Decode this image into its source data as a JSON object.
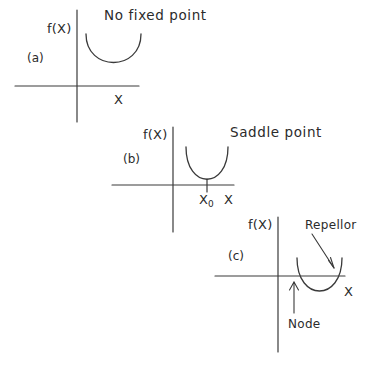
{
  "figure": {
    "title_present": false,
    "background_color": "#ffffff",
    "stroke_color": "#3a3a3a",
    "text_color": "#2b2b2b"
  },
  "panels": [
    {
      "id": "a",
      "panel_label": "(a)",
      "y_axis_label": "f(X)",
      "x_axis_label": "X",
      "caption": "No fixed point",
      "curve_description": "parabola entirely above the X axis",
      "annotations": []
    },
    {
      "id": "b",
      "panel_label": "(b)",
      "y_axis_label": "f(X)",
      "x_axis_label": "X",
      "caption": "Saddle point",
      "curve_description": "parabola tangent to the X axis at X0",
      "tick_label": "X",
      "tick_subscript": "0",
      "annotations": []
    },
    {
      "id": "c",
      "panel_label": "(c)",
      "y_axis_label": "f(X)",
      "x_axis_label": "X",
      "caption": "",
      "curve_description": "parabola crossing the X axis at two points",
      "annotations": [
        {
          "label": "Repellor",
          "points_to": "right-crossing"
        },
        {
          "label": "Node",
          "points_to": "left-crossing"
        }
      ]
    }
  ]
}
